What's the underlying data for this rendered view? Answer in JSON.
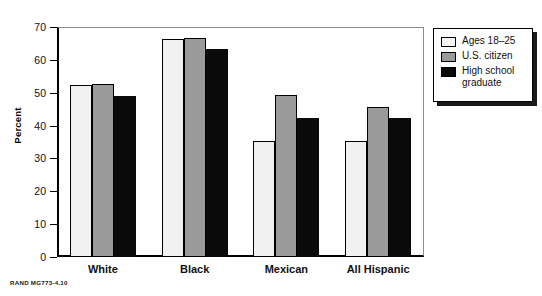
{
  "chart_data": {
    "type": "bar",
    "title": "",
    "xlabel": "",
    "ylabel": "Percent",
    "ylim": [
      0,
      70
    ],
    "yticks": [
      0,
      10,
      20,
      30,
      40,
      50,
      60,
      70
    ],
    "ytick_labels": [
      "0",
      "10",
      "20",
      "30",
      "40",
      "50",
      "60",
      "70"
    ],
    "grid": false,
    "legend_position": "outside-right-top",
    "categories": [
      "White",
      "Black",
      "Mexican",
      "All Hispanic"
    ],
    "series": [
      {
        "name": "Ages 18–25",
        "color": "#f1f1f1",
        "values": [
          52.5,
          66.5,
          35.3,
          35.4
        ]
      },
      {
        "name": "U.S. citizen",
        "color": "#9a9a9a",
        "values": [
          52.6,
          66.6,
          49.2,
          45.7
        ]
      },
      {
        "name": "High school\ngraduate",
        "color": "#0a0a0a",
        "values": [
          49.1,
          63.3,
          42.2,
          42.2
        ]
      }
    ]
  },
  "legend": {
    "items": [
      {
        "label": "Ages 18–25",
        "swatch": "light-swatch"
      },
      {
        "label": "U.S. citizen",
        "swatch": "gray-swatch"
      },
      {
        "label": "High school\ngraduate",
        "swatch": "black-swatch"
      }
    ]
  },
  "footer": {
    "source_note": "RAND MG773-4.10"
  }
}
